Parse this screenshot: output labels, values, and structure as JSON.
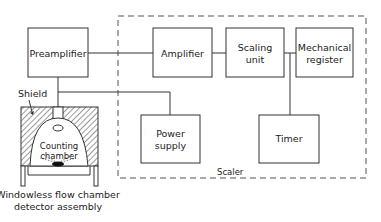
{
  "diagram": {
    "type": "block-diagram",
    "scaler_group": {
      "label": "Scaler"
    },
    "blocks": [
      {
        "id": "preamplifier",
        "label": [
          "Preamplifier"
        ]
      },
      {
        "id": "amplifier",
        "label": [
          "Amplifier"
        ]
      },
      {
        "id": "scaling_unit",
        "label": [
          "Scaling",
          "unit"
        ]
      },
      {
        "id": "mechanical_register",
        "label": [
          "Mechanical",
          "register"
        ]
      },
      {
        "id": "power_supply",
        "label": [
          "Power",
          "supply"
        ]
      },
      {
        "id": "timer",
        "label": [
          "Timer"
        ]
      }
    ],
    "detector": {
      "shield_label": "Shield",
      "chamber_label": [
        "Counting",
        "chamber"
      ],
      "caption": [
        "Windowless flow chamber",
        "detector assembly"
      ]
    },
    "connections": [
      [
        "preamplifier",
        "amplifier"
      ],
      [
        "amplifier",
        "scaling_unit"
      ],
      [
        "scaling_unit",
        "mechanical_register"
      ],
      [
        "scaling_unit",
        "timer"
      ],
      [
        "preamplifier",
        "detector"
      ],
      [
        "preamplifier",
        "power_supply"
      ]
    ]
  }
}
